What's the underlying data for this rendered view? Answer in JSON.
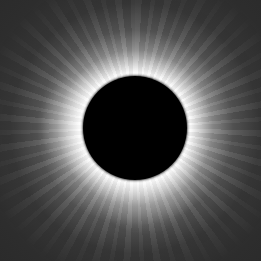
{
  "image": {
    "subject": "total solar eclipse",
    "description": "Black lunar disk surrounded by white solar corona with radial streamers on a dark gray sky",
    "colors": {
      "sky": "#2b2b2b",
      "corona": "#ffffff",
      "moon": "#000000",
      "page_background": "#ffffff"
    }
  }
}
